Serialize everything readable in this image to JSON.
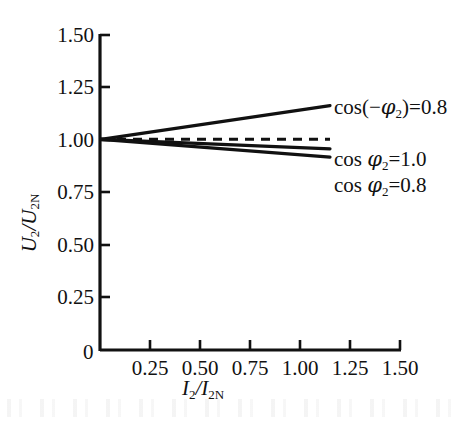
{
  "figure": {
    "background_color": "#ffffff",
    "ink_color": "#111111"
  },
  "axes": {
    "y_label_main": "U",
    "y_label_sub1": "2",
    "y_label_slash": "/U",
    "y_label_sub2": "2N",
    "x_label_main": "I",
    "x_label_sub1": "2",
    "x_label_slash": "/I",
    "x_label_sub2": "2N",
    "origin_label": "0"
  },
  "annotations": {
    "capacitive_prefix": "cos(",
    "capacitive_minus": "−",
    "capacitive_phi": "φ",
    "capacitive_sub": "2",
    "capacitive_suffix": ")=0.8",
    "unity_prefix": "cos ",
    "unity_phi": "φ",
    "unity_sub": "2",
    "unity_suffix": "=1.0",
    "lagging_prefix": "cos ",
    "lagging_phi": "φ",
    "lagging_sub": "2",
    "lagging_suffix": "=0.8"
  },
  "chart_data": {
    "type": "line",
    "title": "",
    "subtitle": "",
    "xlabel": "I2/I2N",
    "ylabel": "U2/U2N",
    "xlim": [
      0,
      1.5
    ],
    "ylim": [
      0,
      1.5
    ],
    "xticks": [
      0,
      0.25,
      0.5,
      0.75,
      1.0,
      1.25,
      1.5
    ],
    "xtick_labels": [
      "0",
      "0.25",
      "0.50",
      "0.75",
      "1.00",
      "1.25",
      "1.50"
    ],
    "yticks": [
      0,
      0.25,
      0.5,
      0.75,
      1.0,
      1.25,
      1.5
    ],
    "ytick_labels": [
      "0",
      "0.25",
      "0.50",
      "0.75",
      "1.00",
      "1.25",
      "1.50"
    ],
    "grid": false,
    "legend_position": "right-inline-annotations",
    "series": [
      {
        "name": "cos(−φ2)=0.8",
        "description": "capacitive (leading) load, voltage rises",
        "style": "solid",
        "linewidth": 3.2,
        "color": "#111111",
        "x": [
          0,
          1.15
        ],
        "values": [
          1.0,
          1.16
        ]
      },
      {
        "name": "reference U2/U2N = 1.0",
        "description": "dashed rated-voltage reference line",
        "style": "dashed",
        "linewidth": 3.0,
        "color": "#111111",
        "x": [
          0,
          1.15
        ],
        "values": [
          1.0,
          1.0
        ]
      },
      {
        "name": "cos φ2=1.0",
        "description": "resistive load, slight voltage drop",
        "style": "solid",
        "linewidth": 3.2,
        "color": "#111111",
        "x": [
          0,
          1.15
        ],
        "values": [
          1.0,
          0.955
        ]
      },
      {
        "name": "cos φ2=0.8",
        "description": "inductive (lagging) load, larger voltage drop",
        "style": "solid",
        "linewidth": 3.2,
        "color": "#111111",
        "x": [
          0,
          1.15
        ],
        "values": [
          1.0,
          0.915
        ]
      }
    ]
  }
}
